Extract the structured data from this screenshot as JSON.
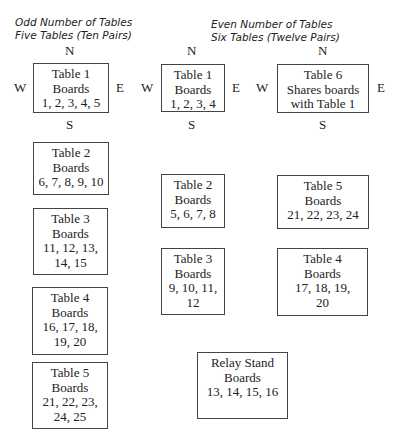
{
  "odd": {
    "title_line1": "Odd Number of Tables",
    "title_line2": "Five Tables (Ten Pairs)",
    "compass": {
      "n": "N",
      "s": "S",
      "e": "E",
      "w": "W"
    },
    "tables": [
      {
        "name": "Table 1",
        "lines": [
          "Table 1",
          "Boards",
          "1, 2, 3, 4, 5"
        ]
      },
      {
        "name": "Table 2",
        "lines": [
          "Table 2",
          "Boards",
          "6, 7, 8, 9, 10"
        ]
      },
      {
        "name": "Table 3",
        "lines": [
          "Table 3",
          "Boards",
          "11, 12, 13,",
          "14, 15"
        ]
      },
      {
        "name": "Table 4",
        "lines": [
          "Table 4",
          "Boards",
          "16, 17, 18,",
          "19, 20"
        ]
      },
      {
        "name": "Table 5",
        "lines": [
          "Table 5",
          "Boards",
          "21, 22, 23,",
          "24, 25"
        ]
      }
    ]
  },
  "even": {
    "title_line1": "Even Number of Tables",
    "title_line2": "Six Tables (Twelve Pairs)",
    "compass": {
      "n": "N",
      "s": "S",
      "e": "E",
      "w": "W"
    },
    "tables": [
      {
        "name": "Table 1",
        "lines": [
          "Table 1",
          "Boards",
          "1, 2, 3, 4"
        ]
      },
      {
        "name": "Table 6",
        "lines": [
          "Table 6",
          "Shares boards",
          "with Table 1"
        ]
      },
      {
        "name": "Table 2",
        "lines": [
          "Table 2",
          "Boards",
          "5, 6, 7, 8"
        ]
      },
      {
        "name": "Table 5",
        "lines": [
          "Table 5",
          "Boards",
          "21, 22, 23, 24"
        ]
      },
      {
        "name": "Table 3",
        "lines": [
          "Table 3",
          "Boards",
          "9, 10, 11,",
          "12"
        ]
      },
      {
        "name": "Table 4",
        "lines": [
          "Table 4",
          "Boards",
          "17, 18, 19,",
          "20"
        ]
      }
    ],
    "relay": {
      "lines": [
        "Relay Stand",
        "Boards",
        "13, 14, 15, 16"
      ]
    }
  }
}
